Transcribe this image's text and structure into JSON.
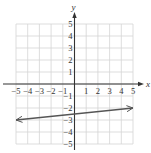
{
  "chart_data": {
    "type": "line",
    "title": "",
    "xlabel": "x",
    "ylabel": "y",
    "xlim": [
      -5,
      5
    ],
    "ylim": [
      -5,
      5
    ],
    "grid": true,
    "x_ticks": [
      -5,
      -4,
      -3,
      -2,
      -1,
      1,
      2,
      3,
      4,
      5
    ],
    "y_ticks": [
      5,
      4,
      3,
      2,
      1,
      -1,
      -2,
      -3,
      -4,
      -5
    ],
    "x_tick_labels": [
      "−5",
      "−4",
      "−3",
      "−2",
      "−1",
      "1",
      "2",
      "3",
      "4",
      "5"
    ],
    "y_tick_labels": [
      "5",
      "4",
      "3",
      "2",
      "1",
      "−1",
      "−2",
      "−3",
      "−4",
      "−5"
    ],
    "series": [
      {
        "name": "line",
        "points": [
          [
            -5,
            -3
          ],
          [
            5,
            -2
          ]
        ],
        "slope": 0.1,
        "y_intercept": -2.5,
        "arrows_both_ends": true
      }
    ],
    "legend": null
  },
  "colors": {
    "grid": "#d4d4d4",
    "axis": "#333333",
    "line": "#555555"
  },
  "labels": {
    "x_axis": "x",
    "y_axis": "y"
  }
}
